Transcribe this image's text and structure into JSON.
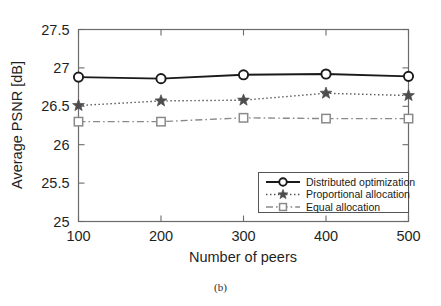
{
  "figure": {
    "caption": "(b)"
  },
  "chart_data": {
    "type": "line",
    "title": "",
    "xlabel": "Number of peers",
    "ylabel": "Average PSNR [dB]",
    "x": [
      100,
      200,
      300,
      400,
      500
    ],
    "xticklabels": [
      "100",
      "200",
      "300",
      "400",
      "500"
    ],
    "yticks": [
      25,
      25.5,
      26,
      26.5,
      27,
      27.5
    ],
    "yticklabels": [
      "25",
      "25.5",
      "26",
      "26.5",
      "27",
      "27.5"
    ],
    "xlim": [
      100,
      500
    ],
    "ylim": [
      25,
      27.5
    ],
    "grid": false,
    "legend_position": "lower right",
    "series": [
      {
        "name": "Distributed optimization",
        "values": [
          26.88,
          26.86,
          26.91,
          26.92,
          26.89
        ],
        "marker": "circle-marker",
        "linestyle": "solid",
        "color": "#1a1a1a"
      },
      {
        "name": "Proportional allocation",
        "values": [
          26.51,
          26.57,
          26.58,
          26.67,
          26.64
        ],
        "marker": "star-marker",
        "linestyle": "dotted",
        "color": "#4d4d4d"
      },
      {
        "name": "Equal allocation",
        "values": [
          26.3,
          26.3,
          26.35,
          26.34,
          26.34
        ],
        "marker": "square-marker",
        "linestyle": "dashdot",
        "color": "#8a8a8a"
      }
    ]
  }
}
